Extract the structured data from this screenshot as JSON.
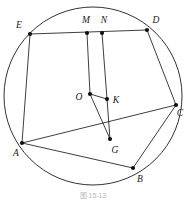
{
  "figure": {
    "caption": "图 15-13",
    "canvas": {
      "width": 186,
      "height": 202
    },
    "colors": {
      "stroke": "#1b1b1b",
      "dot": "#101010",
      "label": "#1a1a1a",
      "background": "#ffffff",
      "caption": "#b9b9b9"
    },
    "circle": {
      "name": "main-circle",
      "cx": 93,
      "cy": 96,
      "r": 89
    },
    "points": [
      {
        "id": "A",
        "label": "A",
        "x": 22,
        "y": 143,
        "lx": 16,
        "ly": 154,
        "dot": true
      },
      {
        "id": "B",
        "label": "B",
        "x": 133,
        "y": 168,
        "lx": 140,
        "ly": 180,
        "dot": true
      },
      {
        "id": "C",
        "label": "C",
        "x": 176,
        "y": 105,
        "lx": 180,
        "ly": 114,
        "dot": true
      },
      {
        "id": "D",
        "label": "D",
        "x": 147,
        "y": 30,
        "lx": 156,
        "ly": 21,
        "dot": true
      },
      {
        "id": "E",
        "label": "E",
        "x": 30,
        "y": 34,
        "lx": 19,
        "ly": 26,
        "dot": true
      },
      {
        "id": "M",
        "label": "M",
        "x": 87,
        "y": 33,
        "lx": 86,
        "ly": 21,
        "dot": true
      },
      {
        "id": "N",
        "label": "N",
        "x": 102,
        "y": 33,
        "lx": 104,
        "ly": 21,
        "dot": true
      },
      {
        "id": "O",
        "label": "O",
        "x": 90,
        "y": 94,
        "lx": 79,
        "ly": 98,
        "dot": true
      },
      {
        "id": "K",
        "label": "K",
        "x": 107,
        "y": 99,
        "lx": 116,
        "ly": 101,
        "dot": true
      },
      {
        "id": "G",
        "label": "G",
        "x": 110,
        "y": 139,
        "lx": 115,
        "ly": 151,
        "dot": true
      }
    ],
    "segments": [
      {
        "name": "segment-E-D",
        "from": "E",
        "to": "D"
      },
      {
        "name": "segment-D-C",
        "from": "D",
        "to": "C"
      },
      {
        "name": "segment-C-B",
        "from": "C",
        "to": "B"
      },
      {
        "name": "segment-B-A",
        "from": "B",
        "to": "A"
      },
      {
        "name": "segment-A-E",
        "from": "A",
        "to": "E"
      },
      {
        "name": "segment-A-C",
        "from": "A",
        "to": "C"
      },
      {
        "name": "segment-M-O",
        "from": "M",
        "to": "O"
      },
      {
        "name": "segment-N-K",
        "from": "N",
        "to": "K"
      },
      {
        "name": "segment-O-K",
        "from": "O",
        "to": "K"
      },
      {
        "name": "segment-O-G",
        "from": "O",
        "to": "G"
      },
      {
        "name": "segment-K-G",
        "from": "K",
        "to": "G"
      }
    ],
    "caption_pos": {
      "x": 93,
      "y": 196
    }
  }
}
